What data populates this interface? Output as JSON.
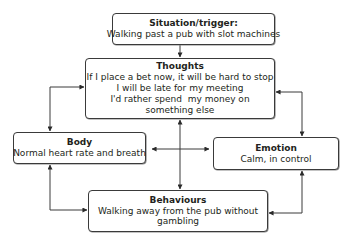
{
  "diagram": {
    "type": "cbt-cycle",
    "nodes": {
      "situation": {
        "title": "Situation/trigger:",
        "lines": [
          "Walking past a pub with slot machines"
        ]
      },
      "thoughts": {
        "title": "Thoughts",
        "lines": [
          "If I place a bet now, it will be hard to stop",
          "I will be late for my meeting",
          "I'd rather spend  my money on",
          "something else"
        ]
      },
      "body": {
        "title": "Body",
        "lines": [
          "Normal heart rate and breath"
        ]
      },
      "emotion": {
        "title": "Emotion",
        "lines": [
          "Calm, in control"
        ]
      },
      "behaviours": {
        "title": "Behaviours",
        "text": "Walking away from the pub without gambling"
      }
    },
    "edges": [
      {
        "from": "situation",
        "to": "thoughts",
        "direction": "one-way"
      },
      {
        "from": "thoughts",
        "to": "body",
        "direction": "two-way"
      },
      {
        "from": "thoughts",
        "to": "emotion",
        "direction": "two-way"
      },
      {
        "from": "body",
        "to": "behaviours",
        "direction": "two-way"
      },
      {
        "from": "emotion",
        "to": "behaviours",
        "direction": "two-way"
      },
      {
        "from": "thoughts",
        "to": "behaviours",
        "direction": "two-way"
      },
      {
        "from": "body",
        "to": "emotion",
        "direction": "two-way"
      }
    ],
    "colors": {
      "stroke": "#3a3a3a",
      "text": "#231f20",
      "background": "#ffffff"
    }
  }
}
